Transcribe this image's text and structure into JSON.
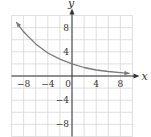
{
  "chart_data": {
    "type": "line",
    "title": "",
    "xlabel": "x",
    "ylabel": "y",
    "xlim": [
      -10,
      10
    ],
    "ylim": [
      -10,
      10
    ],
    "grid": true,
    "grid_step": 2,
    "x_ticks": [
      -8,
      -4,
      0,
      4,
      8
    ],
    "y_ticks": [
      8,
      4,
      -4,
      -8
    ],
    "x_tick_labels": [
      "−8",
      "−4",
      "0",
      "4",
      "8"
    ],
    "y_tick_labels": [
      "8",
      "4",
      "−4",
      "−8"
    ],
    "series": [
      {
        "name": "exponential decay",
        "function": "y = 2(0.85)^x",
        "x": [
          -9.2,
          -8,
          -6,
          -4,
          -2,
          0,
          2,
          4,
          6,
          8,
          9.5
        ],
        "y": [
          8.9,
          7.3,
          5.3,
          3.8,
          2.8,
          2.0,
          1.4,
          1.0,
          0.75,
          0.54,
          0.43
        ],
        "arrows": "both"
      }
    ],
    "colors": {
      "curve": "#7a7a7a",
      "axis": "#333333",
      "grid": "#d8d8d8"
    }
  }
}
